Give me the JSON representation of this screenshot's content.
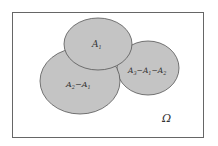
{
  "diagram": {
    "type": "venn",
    "universe": {
      "label": "Ω"
    },
    "sets": [
      {
        "id": "A1",
        "label_main": "A",
        "label_sub": "1"
      },
      {
        "id": "A2_minus_A1",
        "parts": [
          {
            "main": "A",
            "sub": "2"
          },
          {
            "op": "−"
          },
          {
            "main": "A",
            "sub": "1"
          }
        ]
      },
      {
        "id": "A3_minus_A1_minus_A2",
        "parts": [
          {
            "main": "A",
            "sub": "3"
          },
          {
            "op": "−"
          },
          {
            "main": "A",
            "sub": "1"
          },
          {
            "op": "−"
          },
          {
            "main": "A",
            "sub": "2"
          }
        ]
      }
    ],
    "colors": {
      "fill": "#c4c4c4",
      "stroke": "#555555",
      "frame": "#666666",
      "background": "#ffffff"
    }
  }
}
